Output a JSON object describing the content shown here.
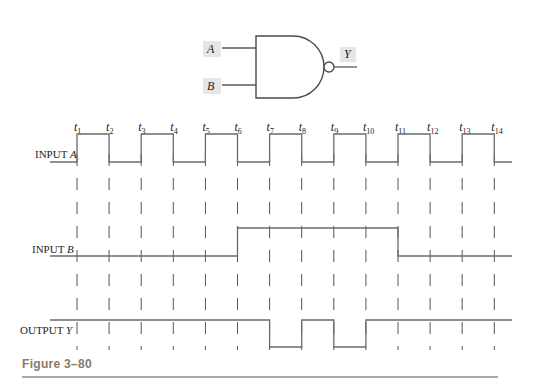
{
  "gate": {
    "type": "NAND",
    "inputs": [
      "A",
      "B"
    ],
    "output": "Y"
  },
  "timing": {
    "time_marks": [
      "t1",
      "t2",
      "t3",
      "t4",
      "t5",
      "t6",
      "t7",
      "t8",
      "t9",
      "t10",
      "t11",
      "t12",
      "t13",
      "t14"
    ],
    "signals": [
      {
        "label_prefix": "INPUT ",
        "label_var": "A",
        "levels": [
          0,
          1,
          0,
          1,
          0,
          1,
          0,
          1,
          0,
          1,
          0,
          1,
          0,
          1,
          0
        ]
      },
      {
        "label_prefix": "INPUT ",
        "label_var": "B",
        "levels": [
          0,
          0,
          0,
          0,
          0,
          0,
          1,
          1,
          1,
          1,
          1,
          0,
          0,
          0,
          0
        ]
      },
      {
        "label_prefix": "OUTPUT ",
        "label_var": "Y",
        "levels": [
          1,
          1,
          1,
          1,
          1,
          1,
          1,
          0,
          1,
          0,
          1,
          1,
          1,
          1,
          1
        ]
      }
    ]
  },
  "caption": "Figure 3–80"
}
